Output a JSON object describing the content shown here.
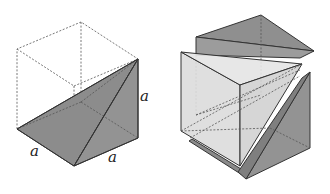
{
  "figure": {
    "colors": {
      "dark_face": "#8c8c8c",
      "dark_face_2": "#9a9a9a",
      "light_face": "#d9d9d9",
      "edge": "#333333",
      "dashed": "#555555"
    },
    "left": {
      "labels": [
        {
          "text": "a",
          "x": 30,
          "y": 156
        },
        {
          "text": "a",
          "x": 140,
          "y": 101
        },
        {
          "text": "a",
          "x": 108,
          "y": 162
        }
      ]
    }
  }
}
